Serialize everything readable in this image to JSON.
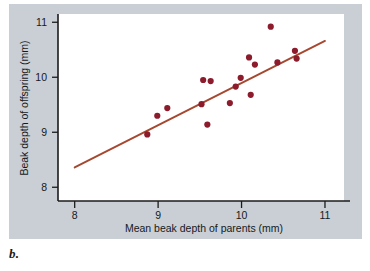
{
  "figure": {
    "panel_letter": "b.",
    "background_color": "#c9cfd5",
    "plot_background_color": "#ffffff",
    "point_color": "#8c1b2c",
    "line_color": "#a6472f",
    "axis_color": "#1b1b1b"
  },
  "chart_data": {
    "type": "scatter",
    "title": "",
    "xlabel": "Mean beak depth of parents (mm)",
    "ylabel": "Beak depth of offspring (mm)",
    "xlim": [
      7.8,
      11.3
    ],
    "ylim": [
      7.75,
      11.15
    ],
    "xticks": [
      8,
      9,
      10,
      11
    ],
    "yticks": [
      8,
      9,
      10,
      11
    ],
    "xtick_labels": [
      "8",
      "9",
      "10",
      "11"
    ],
    "ytick_labels": [
      "8",
      "9",
      "10",
      "11"
    ],
    "grid": false,
    "legend": null,
    "points": [
      {
        "x": 8.87,
        "y": 8.96
      },
      {
        "x": 8.99,
        "y": 9.3
      },
      {
        "x": 9.11,
        "y": 9.44
      },
      {
        "x": 9.52,
        "y": 9.51
      },
      {
        "x": 9.54,
        "y": 9.95
      },
      {
        "x": 9.59,
        "y": 9.14
      },
      {
        "x": 9.63,
        "y": 9.93
      },
      {
        "x": 9.86,
        "y": 9.53
      },
      {
        "x": 9.93,
        "y": 9.83
      },
      {
        "x": 9.99,
        "y": 9.99
      },
      {
        "x": 10.09,
        "y": 10.36
      },
      {
        "x": 10.11,
        "y": 9.68
      },
      {
        "x": 10.16,
        "y": 10.23
      },
      {
        "x": 10.35,
        "y": 10.92
      },
      {
        "x": 10.43,
        "y": 10.27
      },
      {
        "x": 10.64,
        "y": 10.48
      },
      {
        "x": 10.66,
        "y": 10.34
      }
    ],
    "fit_line": {
      "name": "regression-line",
      "x0": 8.0,
      "y0": 8.36,
      "x1": 11.0,
      "y1": 10.66
    }
  }
}
